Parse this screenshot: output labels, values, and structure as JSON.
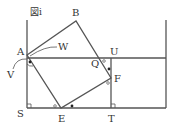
{
  "figure": {
    "title": "図ⅰ",
    "labels": {
      "A": "A",
      "B": "B",
      "W": "W",
      "V": "V",
      "U": "U",
      "Q": "Q",
      "F": "F",
      "S": "S",
      "E": "E",
      "T": "T"
    },
    "colors": {
      "line": "#555555",
      "text": "#333333",
      "background": "#ffffff"
    }
  }
}
